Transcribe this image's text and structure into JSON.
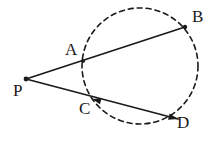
{
  "figure": {
    "name": "circle-with-two-secants-from-external-point",
    "background_color": "#ffffff",
    "stroke_color": "#1a1a1a",
    "canvas": {
      "width": 221,
      "height": 145
    },
    "circle": {
      "style": "dashed",
      "center_x": 140,
      "center_y": 66,
      "radius": 58,
      "dash_pattern": "5 4",
      "stroke_width": 1.6
    },
    "segments": [
      {
        "name": "secant-P-to-B",
        "from": "P",
        "to": "B",
        "x1": 26,
        "y1": 79,
        "x2": 185,
        "y2": 27,
        "style": "solid",
        "stroke_width": 1.8,
        "arrowhead_at_end": false
      },
      {
        "name": "secant-P-to-D",
        "from": "P",
        "to": "D",
        "x1": 26,
        "y1": 79,
        "x2": 178,
        "y2": 119,
        "style": "solid",
        "stroke_width": 1.8,
        "arrowhead_at_end": true
      }
    ],
    "arrow_markers": [
      {
        "name": "arrowhead-toward-C",
        "x": 92,
        "y": 99,
        "angle_deg": 194
      },
      {
        "name": "arrowhead-toward-D",
        "x": 178,
        "y": 119,
        "angle_deg": 15
      }
    ],
    "points": [
      {
        "id": "P",
        "label": "P",
        "x": 26,
        "y": 79,
        "label_x": 13,
        "label_y": 82,
        "dot": true,
        "role": "external-point"
      },
      {
        "id": "A",
        "label": "A",
        "x": 83,
        "y": 61,
        "label_x": 65,
        "label_y": 41,
        "dot": true,
        "role": "near-intersection-upper-secant"
      },
      {
        "id": "B",
        "label": "B",
        "x": 185,
        "y": 27,
        "label_x": 192,
        "label_y": 8,
        "dot": true,
        "role": "far-intersection-upper-secant"
      },
      {
        "id": "C",
        "label": "C",
        "x": 92,
        "y": 99,
        "label_x": 79,
        "label_y": 100,
        "dot": false,
        "role": "near-intersection-lower-secant"
      },
      {
        "id": "D",
        "label": "D",
        "x": 178,
        "y": 119,
        "label_x": 177,
        "label_y": 114,
        "dot": false,
        "role": "far-intersection-lower-secant"
      }
    ]
  }
}
